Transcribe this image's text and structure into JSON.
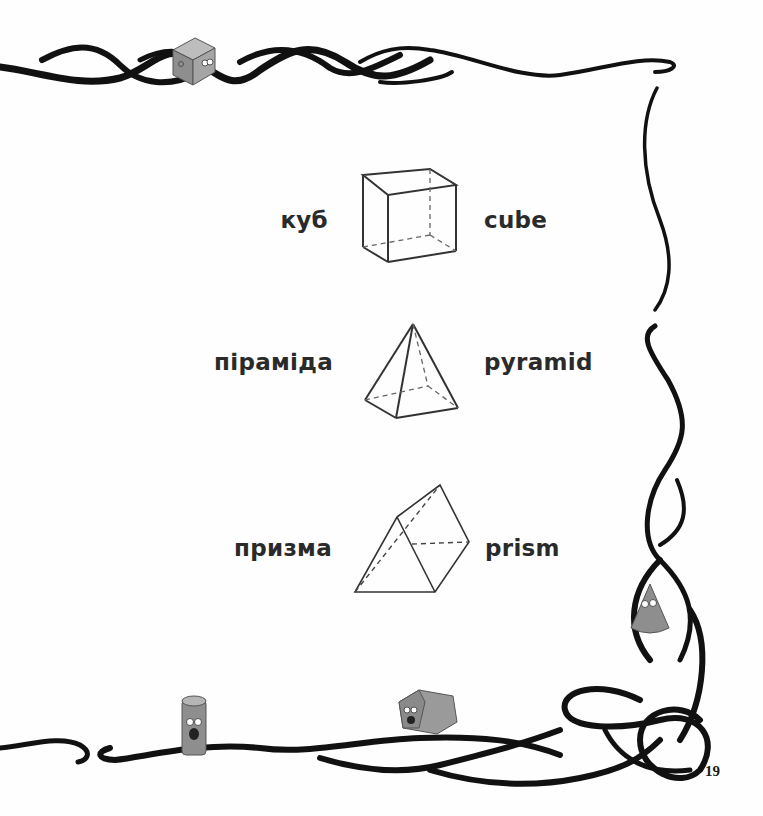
{
  "page": {
    "number": "19"
  },
  "vocabulary": [
    {
      "ukrainian": "куб",
      "english": "cube",
      "shape": "cube-icon"
    },
    {
      "ukrainian": "піраміда",
      "english": "pyramid",
      "shape": "pyramid-icon"
    },
    {
      "ukrainian": "призма",
      "english": "prism",
      "shape": "prism-icon"
    }
  ],
  "decorations": {
    "border_color": "#111111",
    "mascot_color": "#8e8e8e",
    "mascots": [
      "cube-mascot",
      "cone-mascot",
      "cylinder-mascot",
      "hexagonal-prism-mascot"
    ]
  }
}
